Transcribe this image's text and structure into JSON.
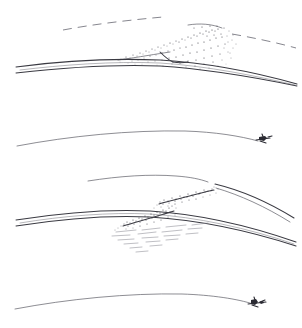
{
  "figure": {
    "background_color": "#ffffff",
    "ink_color": "#3a3a42",
    "stipple_color": "#43434c",
    "panel_count": 4
  },
  "panels": [
    {
      "id": "panel-1",
      "name": "upper-wave-cloud-panel",
      "label": "",
      "features": [
        "dashed upper streamline",
        "stippled triangular cloud mass with crest at right",
        "paired solid flow lines below",
        "small dark notch beneath cloud base"
      ]
    },
    {
      "id": "panel-2",
      "name": "clear-streamline-panel-upper",
      "label": "",
      "features": [
        "single smooth arched streamline",
        "aircraft silhouette at right descending limb"
      ]
    },
    {
      "id": "panel-3",
      "name": "double-band-turbulence-panel",
      "label": "",
      "features": [
        "thin upper arc streamline",
        "two parallel stippled diagonal bands rising to the right",
        "paired solid flow lines below",
        "horizontal hatched layer beneath bands",
        "splayed streamlines at right edge"
      ]
    },
    {
      "id": "panel-4",
      "name": "clear-streamline-panel-lower",
      "label": "",
      "features": [
        "single smooth arched streamline",
        "aircraft silhouette at right descending limb"
      ]
    }
  ],
  "aircraft": {
    "name": "aircraft-silhouette",
    "count": 2,
    "color": "#2b2b33"
  }
}
